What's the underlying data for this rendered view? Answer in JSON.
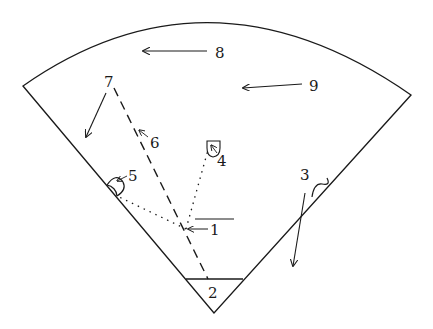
{
  "diagram": {
    "type": "sector-with-labeled-parts",
    "stroke_color": "#1a1a1a",
    "background": "#ffffff",
    "labels": [
      {
        "id": "1",
        "text": "1"
      },
      {
        "id": "2",
        "text": "2"
      },
      {
        "id": "3",
        "text": "3"
      },
      {
        "id": "4",
        "text": "4"
      },
      {
        "id": "5",
        "text": "5"
      },
      {
        "id": "6",
        "text": "6"
      },
      {
        "id": "7",
        "text": "7"
      },
      {
        "id": "8",
        "text": "8"
      },
      {
        "id": "9",
        "text": "9"
      }
    ]
  }
}
